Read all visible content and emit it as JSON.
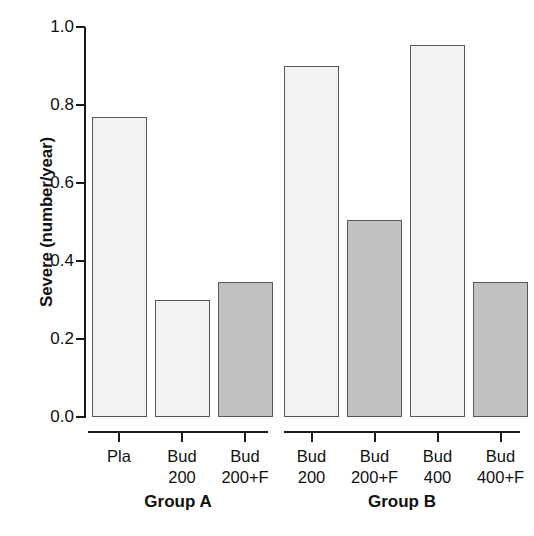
{
  "chart_data": {
    "type": "bar",
    "title": "",
    "xlabel": "",
    "ylabel": "Severe (number/year)",
    "ylim": [
      0.0,
      1.0
    ],
    "grid": false,
    "legend": "none",
    "y_ticks": [
      "0.0",
      "0.2",
      "0.4",
      "0.6",
      "0.8",
      "1.0"
    ],
    "y_tick_values": [
      0.0,
      0.2,
      0.4,
      0.6,
      0.8,
      1.0
    ],
    "panels": [
      {
        "name": "Group A",
        "categories": [
          "Pla",
          "Bud 200",
          "Bud 200+F"
        ],
        "category_lines": [
          {
            "line1": "Pla",
            "line2": ""
          },
          {
            "line1": "Bud",
            "line2": "200"
          },
          {
            "line1": "Bud",
            "line2": "200+F"
          }
        ],
        "values": [
          0.77,
          0.3,
          0.345
        ],
        "fills": [
          "light",
          "light",
          "dark"
        ]
      },
      {
        "name": "Group B",
        "categories": [
          "Bud 200",
          "Bud 200+F",
          "Bud 400",
          "Bud 400+F"
        ],
        "category_lines": [
          {
            "line1": "Bud",
            "line2": "200"
          },
          {
            "line1": "Bud",
            "line2": "200+F"
          },
          {
            "line1": "Bud",
            "line2": "400"
          },
          {
            "line1": "Bud",
            "line2": "400+F"
          }
        ],
        "values": [
          0.9,
          0.505,
          0.955,
          0.345
        ],
        "fills": [
          "light",
          "dark",
          "light",
          "dark"
        ]
      }
    ],
    "colors": {
      "light_bar_fill": "#f2f2f2",
      "dark_bar_fill": "#c2c2c2",
      "bar_border": "#575757",
      "axis": "#1a1a1a",
      "text": "#111111",
      "background": "#ffffff"
    }
  }
}
